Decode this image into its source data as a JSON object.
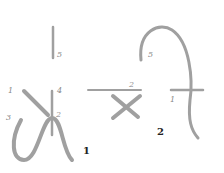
{
  "figures": [
    {
      "label": "1",
      "strokes": [
        "1",
        "2",
        "3",
        "4",
        "5"
      ]
    },
    {
      "label": "2",
      "strokes": [
        "1",
        "2",
        "5"
      ]
    }
  ],
  "colors": {
    "stroke": "#9a9a9a",
    "label": "#888888",
    "figure_label": "#222222"
  }
}
